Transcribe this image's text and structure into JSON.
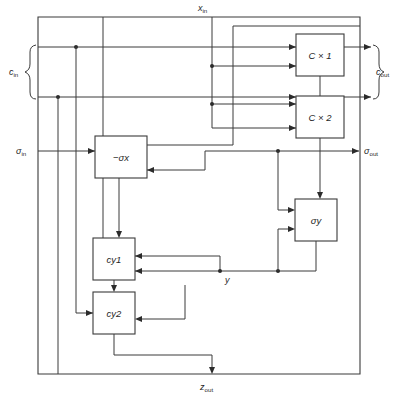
{
  "diagram": {
    "type": "block-diagram",
    "title": "",
    "blocks": [
      {
        "id": "cx1",
        "label": "C × 1",
        "x": 296,
        "y": 34,
        "w": 48,
        "h": 42
      },
      {
        "id": "cx2",
        "label": "C × 2",
        "x": 296,
        "y": 96,
        "w": 48,
        "h": 42
      },
      {
        "id": "sx",
        "label": "−σx",
        "x": 95,
        "y": 136,
        "w": 52,
        "h": 42
      },
      {
        "id": "sy",
        "label": "σy",
        "x": 295,
        "y": 199,
        "w": 42,
        "h": 42
      },
      {
        "id": "cy1",
        "label": "cy1",
        "x": 93,
        "y": 238,
        "w": 42,
        "h": 42
      },
      {
        "id": "cy2",
        "label": "cy2",
        "x": 93,
        "y": 292,
        "w": 42,
        "h": 42
      }
    ],
    "ports": [
      {
        "id": "xin",
        "label": "x",
        "sub": "in",
        "x": 205,
        "y": 11,
        "side": "top"
      },
      {
        "id": "cin",
        "label": "c",
        "sub": "in",
        "x": 22,
        "y": 72,
        "side": "left"
      },
      {
        "id": "sigin",
        "label": "σ",
        "sub": "in",
        "x": 28,
        "y": 151,
        "side": "left"
      },
      {
        "id": "cout",
        "label": "c",
        "sub": "out",
        "x": 381,
        "y": 72,
        "side": "right"
      },
      {
        "id": "sigout",
        "label": "σ",
        "sub": "out",
        "x": 369,
        "y": 151,
        "side": "right"
      },
      {
        "id": "zout",
        "label": "z",
        "sub": "out",
        "x": 205,
        "y": 385,
        "side": "bottom"
      },
      {
        "id": "y",
        "label": "y",
        "sub": "",
        "x": 228,
        "y": 271,
        "side": "inline"
      }
    ],
    "signals": [
      "x_in",
      "c_in",
      "sigma_in",
      "c_out",
      "sigma_out",
      "z_out",
      "y"
    ],
    "colors": {
      "line": "#3a3a3a",
      "text": "#1f1f1f",
      "background": "#ffffff"
    }
  }
}
